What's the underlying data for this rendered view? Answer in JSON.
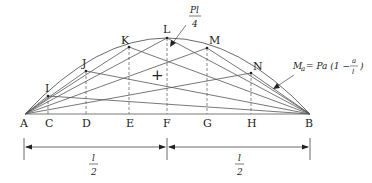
{
  "diagram": {
    "support_left": "A",
    "support_right": "B",
    "base_points": [
      "C",
      "D",
      "E",
      "F",
      "G",
      "H"
    ],
    "curve_points": [
      "I",
      "J",
      "K",
      "L",
      "M",
      "N"
    ],
    "peak_label_num": "Pl",
    "peak_label_den": "4",
    "formula_lhs": "M",
    "formula_sub": "a",
    "formula_rhs_pre": " = Pa (1 − ",
    "formula_frac_num": "a",
    "formula_frac_den": "l",
    "formula_close": ")",
    "center_mark": "+",
    "dim_left_num": "l",
    "dim_left_den": "2",
    "dim_right_num": "l",
    "dim_right_den": "2"
  }
}
